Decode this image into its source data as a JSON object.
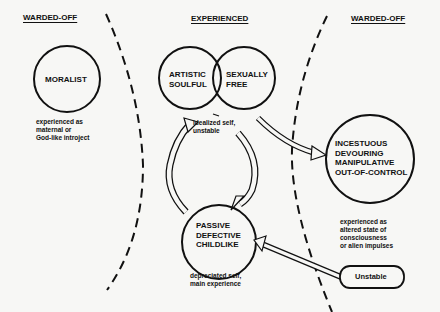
{
  "headers": {
    "left": "WARDED-OFF",
    "center": "EXPERIENCED",
    "right": "WARDED-OFF"
  },
  "nodes": {
    "moralist": {
      "label": "MORALIST",
      "caption": "experienced as\nmaternal or\nGod-like introject"
    },
    "artistic": {
      "line1": "ARTISTIC",
      "line2": "SOULFUL"
    },
    "sexually": {
      "line1": "SEXUALLY",
      "line2": "FREE"
    },
    "idealized_caption": "idealized self,\nunstable",
    "passive": {
      "line1": "PASSIVE",
      "line2": "DEFECTIVE",
      "line3": "CHILDLIKE",
      "caption": "depreciated self,\nmain experience"
    },
    "incestuous": {
      "line1": "INCESTUOUS",
      "line2": "DEVOURING",
      "line3": "MANIPULATIVE",
      "line4": "OUT-OF-CONTROL",
      "caption": "experienced as\naltered state of\nconsciousness\nor alien impulses"
    },
    "unstable": {
      "label": "Unstable"
    }
  },
  "colors": {
    "ink": "#111111",
    "paper": "#f7f7f5"
  }
}
